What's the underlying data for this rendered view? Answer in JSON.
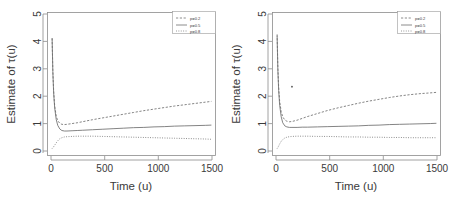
{
  "figure": {
    "panel_count": 2,
    "background_color": "#ffffff",
    "line_color": "#6e6e6e",
    "axis_color": "#8c8c8c",
    "text_color": "#3a3a3a"
  },
  "chart_data": [
    {
      "type": "line",
      "panel": "left",
      "title": "",
      "xlabel": "Time (u)",
      "ylabel": "Estimate of τ(u)",
      "xlim": [
        -40,
        1600
      ],
      "ylim": [
        -0.25,
        5.3
      ],
      "xticks": [
        0,
        500,
        1000,
        1500
      ],
      "yticks": [
        0,
        1,
        2,
        3,
        4,
        5
      ],
      "xtick_labels": [
        "0",
        "500",
        "1000",
        "1500"
      ],
      "ytick_labels": [
        "0",
        "1",
        "2",
        "3",
        "4",
        "5"
      ],
      "grid": false,
      "legend_position": "top-right",
      "legend_entries": [
        "p=0.2",
        "p=0.5",
        "p=0.8"
      ],
      "x": [
        5,
        12,
        20,
        30,
        45,
        60,
        80,
        100,
        125,
        150,
        200,
        250,
        300,
        400,
        500,
        600,
        700,
        800,
        900,
        1000,
        1100,
        1200,
        1300,
        1400,
        1500,
        1560
      ],
      "series": [
        {
          "name": "p=0.2",
          "style": "dashed",
          "values": [
            4.3,
            3.05,
            2.25,
            1.68,
            1.28,
            1.1,
            1.0,
            0.96,
            0.95,
            0.96,
            0.99,
            1.02,
            1.06,
            1.14,
            1.21,
            1.28,
            1.35,
            1.42,
            1.49,
            1.55,
            1.61,
            1.67,
            1.72,
            1.77,
            1.82,
            1.85
          ]
        },
        {
          "name": "p=0.5",
          "style": "solid",
          "values": [
            4.3,
            3.0,
            2.18,
            1.6,
            1.15,
            0.92,
            0.78,
            0.72,
            0.7,
            0.7,
            0.71,
            0.72,
            0.73,
            0.75,
            0.77,
            0.79,
            0.81,
            0.83,
            0.84,
            0.86,
            0.87,
            0.89,
            0.9,
            0.91,
            0.92,
            0.93
          ]
        },
        {
          "name": "p=0.8",
          "style": "dotted",
          "values": [
            0.02,
            0.05,
            0.09,
            0.15,
            0.24,
            0.32,
            0.4,
            0.44,
            0.47,
            0.48,
            0.49,
            0.5,
            0.5,
            0.5,
            0.49,
            0.48,
            0.47,
            0.46,
            0.45,
            0.44,
            0.43,
            0.42,
            0.41,
            0.4,
            0.39,
            0.38
          ]
        }
      ]
    },
    {
      "type": "line",
      "panel": "right",
      "title": "",
      "xlabel": "Time (u)",
      "ylabel": "Estimate of τ(u)",
      "xlim": [
        -40,
        1600
      ],
      "ylim": [
        -0.25,
        5.3
      ],
      "xticks": [
        0,
        500,
        1000,
        1500
      ],
      "yticks": [
        0,
        1,
        2,
        3,
        4,
        5
      ],
      "xtick_labels": [
        "0",
        "500",
        "1000",
        "1500"
      ],
      "ytick_labels": [
        "0",
        "1",
        "2",
        "3",
        "4",
        "5"
      ],
      "grid": false,
      "legend_position": "top-right",
      "legend_entries": [
        "p=0.2",
        "p=0.5",
        "p=0.8"
      ],
      "annotations": [
        {
          "name": "outlier-point",
          "x": 150,
          "y": 2.42
        }
      ],
      "x": [
        5,
        12,
        20,
        30,
        45,
        60,
        80,
        100,
        125,
        150,
        200,
        250,
        300,
        400,
        500,
        600,
        700,
        800,
        900,
        1000,
        1100,
        1200,
        1300,
        1400,
        1500,
        1560
      ],
      "series": [
        {
          "name": "p=0.2",
          "style": "dashed",
          "values": [
            4.45,
            3.2,
            2.4,
            1.85,
            1.45,
            1.25,
            1.13,
            1.08,
            1.06,
            1.07,
            1.12,
            1.19,
            1.26,
            1.38,
            1.5,
            1.6,
            1.69,
            1.78,
            1.86,
            1.93,
            2.0,
            2.06,
            2.11,
            2.15,
            2.18,
            2.2
          ]
        },
        {
          "name": "p=0.5",
          "style": "solid",
          "values": [
            4.4,
            3.1,
            2.28,
            1.7,
            1.25,
            1.02,
            0.9,
            0.86,
            0.84,
            0.84,
            0.84,
            0.85,
            0.85,
            0.86,
            0.87,
            0.88,
            0.89,
            0.9,
            0.92,
            0.93,
            0.95,
            0.96,
            0.97,
            0.98,
            0.99,
            1.0
          ]
        },
        {
          "name": "p=0.8",
          "style": "dotted",
          "values": [
            0.02,
            0.06,
            0.12,
            0.2,
            0.3,
            0.37,
            0.43,
            0.46,
            0.48,
            0.49,
            0.5,
            0.5,
            0.5,
            0.49,
            0.49,
            0.48,
            0.47,
            0.47,
            0.46,
            0.46,
            0.45,
            0.45,
            0.44,
            0.44,
            0.44,
            0.44
          ]
        }
      ]
    }
  ]
}
